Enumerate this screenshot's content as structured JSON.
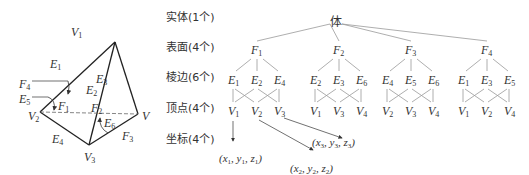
{
  "tetrahedron": {
    "vertices": [
      {
        "name": "V",
        "sub": "1",
        "x": 115,
        "y": 42
      },
      {
        "name": "V",
        "sub": "2",
        "x": 40,
        "y": 112
      },
      {
        "name": "V",
        "sub": "3",
        "x": 89,
        "y": 145
      },
      {
        "name": "V",
        "sub": "",
        "x": 138,
        "y": 114
      }
    ],
    "labels": [
      {
        "id": "V1",
        "name": "V",
        "sub": "1",
        "x": 71,
        "y": 26
      },
      {
        "id": "V2",
        "name": "V",
        "sub": "2",
        "x": 28,
        "y": 110
      },
      {
        "id": "V3",
        "name": "V",
        "sub": "3",
        "x": 84,
        "y": 151
      },
      {
        "id": "V4",
        "name": "V",
        "sub": "",
        "x": 142,
        "y": 110
      },
      {
        "id": "E1",
        "name": "E",
        "sub": "1",
        "x": 50,
        "y": 58
      },
      {
        "id": "E2",
        "name": "E",
        "sub": "2",
        "x": 86,
        "y": 84
      },
      {
        "id": "E3",
        "name": "E",
        "sub": "3",
        "x": 96,
        "y": 73
      },
      {
        "id": "E4",
        "name": "E",
        "sub": "4",
        "x": 52,
        "y": 133
      },
      {
        "id": "E5",
        "name": "E",
        "sub": "5",
        "x": 19,
        "y": 93
      },
      {
        "id": "E6",
        "name": "E",
        "sub": "6",
        "x": 104,
        "y": 117
      },
      {
        "id": "F1",
        "name": "F",
        "sub": "1",
        "x": 58,
        "y": 100
      },
      {
        "id": "F2",
        "name": "F",
        "sub": "2",
        "x": 91,
        "y": 102
      },
      {
        "id": "F3",
        "name": "F",
        "sub": "3",
        "x": 122,
        "y": 130
      },
      {
        "id": "F4",
        "name": "F",
        "sub": "4",
        "x": 19,
        "y": 78
      }
    ]
  },
  "hierarchy": {
    "row_labels": [
      {
        "text": "实体(1个)",
        "y": 12
      },
      {
        "text": "表面(4个)",
        "y": 42
      },
      {
        "text": "棱边(6个)",
        "y": 72
      },
      {
        "text": "顶点(4个)",
        "y": 103
      },
      {
        "text": "坐标(4个)",
        "y": 134
      }
    ],
    "root": {
      "text": "体",
      "x": 336,
      "y": 16
    },
    "faces": [
      {
        "name": "F",
        "sub": "1",
        "x": 253,
        "edges": [
          {
            "sub": "1"
          },
          {
            "sub": "2"
          },
          {
            "sub": "4"
          }
        ],
        "vertices": [
          {
            "sub": "1"
          },
          {
            "sub": "2"
          },
          {
            "sub": "3"
          }
        ]
      },
      {
        "name": "F",
        "sub": "2",
        "x": 335,
        "edges": [
          {
            "sub": "2"
          },
          {
            "sub": "3"
          },
          {
            "sub": "6"
          }
        ],
        "vertices": [
          {
            "sub": "1"
          },
          {
            "sub": "3"
          },
          {
            "sub": "4"
          }
        ]
      },
      {
        "name": "F",
        "sub": "3",
        "x": 407,
        "edges": [
          {
            "sub": "4"
          },
          {
            "sub": "5"
          },
          {
            "sub": "6"
          }
        ],
        "vertices": [
          {
            "sub": "2"
          },
          {
            "sub": "3"
          },
          {
            "sub": "4"
          }
        ]
      },
      {
        "name": "F",
        "sub": "4",
        "x": 483,
        "edges": [
          {
            "sub": "1"
          },
          {
            "sub": "3"
          },
          {
            "sub": "5"
          }
        ],
        "vertices": [
          {
            "sub": "1"
          },
          {
            "sub": "2"
          },
          {
            "sub": "4"
          }
        ]
      }
    ],
    "coordinates": [
      {
        "x_sub": "1",
        "y_sub": "1",
        "z_sub": "1",
        "text_x": 219,
        "text_y": 153
      },
      {
        "x_sub": "2",
        "y_sub": "2",
        "z_sub": "2",
        "text_x": 290,
        "text_y": 163
      },
      {
        "x_sub": "3",
        "y_sub": "3",
        "z_sub": "3",
        "text_x": 312,
        "text_y": 137
      }
    ]
  }
}
